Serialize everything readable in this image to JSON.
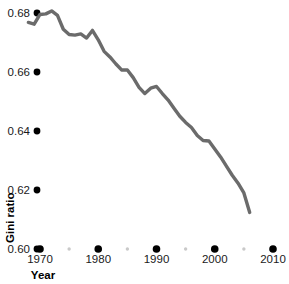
{
  "chart_data": {
    "type": "line",
    "title": "",
    "subtitle": "",
    "xlabel": "Year",
    "ylabel": "Gini ratio",
    "xlim": [
      1968,
      2011
    ],
    "ylim": [
      0.6,
      0.685
    ],
    "grid": false,
    "legend": null,
    "x_major_ticks": [
      1970,
      1980,
      1990,
      2000,
      2010
    ],
    "x_major_tick_labels": [
      "1970",
      "1980",
      "1990",
      "2000",
      "2010"
    ],
    "x_minor_ticks": [
      1975,
      1985,
      1995,
      2005
    ],
    "y_ticks": [
      0.6,
      0.62,
      0.64,
      0.66,
      0.68
    ],
    "y_tick_labels": [
      "0.60",
      "0.62",
      "0.64",
      "0.66",
      "0.68"
    ],
    "series": [
      {
        "name": "Gini ratio",
        "color": "#6b6b6b",
        "x": [
          1968,
          1969,
          1970,
          1971,
          1972,
          1973,
          1974,
          1975,
          1976,
          1977,
          1978,
          1979,
          1980,
          1981,
          1982,
          1983,
          1984,
          1985,
          1986,
          1987,
          1988,
          1989,
          1990,
          1991,
          1992,
          1993,
          1994,
          1995,
          1996,
          1997,
          1998,
          1999,
          2000,
          2001,
          2002,
          2003,
          2004,
          2005,
          2006
        ],
        "values": [
          0.6768,
          0.6762,
          0.6795,
          0.6797,
          0.6807,
          0.6792,
          0.6745,
          0.6727,
          0.6725,
          0.6729,
          0.6715,
          0.6741,
          0.6709,
          0.667,
          0.6651,
          0.6628,
          0.6607,
          0.6607,
          0.6581,
          0.6548,
          0.6527,
          0.6545,
          0.6551,
          0.6527,
          0.6505,
          0.6477,
          0.645,
          0.6429,
          0.6412,
          0.6385,
          0.6368,
          0.6366,
          0.6339,
          0.6312,
          0.6281,
          0.625,
          0.6223,
          0.619,
          0.6124
        ]
      }
    ]
  },
  "axes": {
    "y_label": "Gini ratio",
    "x_label": "Year"
  }
}
